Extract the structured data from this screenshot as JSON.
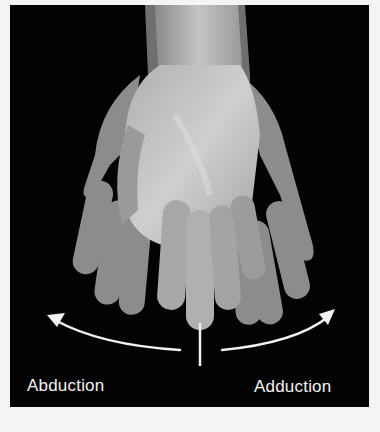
{
  "figure": {
    "labels": {
      "left": "Abduction",
      "right": "Adduction"
    },
    "colors": {
      "background": "#030303",
      "page": "#f4f4f2",
      "arrow": "#f2f2f2",
      "skin_front": "#b9b9b9",
      "skin_back": "#8e8e8e"
    }
  }
}
